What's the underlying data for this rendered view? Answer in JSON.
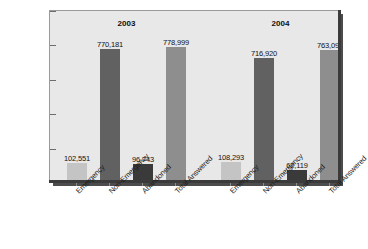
{
  "chart_data": {
    "type": "bar",
    "title": "",
    "xlabel": "",
    "ylabel": "",
    "ylim": [
      0,
      1000000
    ],
    "grid": false,
    "legend": "none",
    "ytick_labels": [
      "0",
      "200,000",
      "400,000",
      "600,000",
      "800,000",
      "1,000,000"
    ],
    "ytick_values": [
      0,
      200000,
      400000,
      600000,
      800000,
      1000000
    ],
    "group_labels": [
      "2003",
      "2004"
    ],
    "categories": [
      "Emergency",
      "Non-Emergency",
      "Abandoned",
      "Total Answered"
    ],
    "series": [
      {
        "name": "2003",
        "values": [
          102551,
          770181,
          96743,
          778999
        ],
        "value_labels": [
          "102,551",
          "770,181",
          "96,743",
          "778,999"
        ]
      },
      {
        "name": "2004",
        "values": [
          108293,
          716920,
          62119,
          763094
        ],
        "value_labels": [
          "108,293",
          "716,920",
          "62,119",
          "763,094"
        ]
      }
    ],
    "bar_colors": {
      "Emergency": "#c4c4c4",
      "Non-Emergency": "#616161",
      "Abandoned": "#3a3a3a",
      "Total Answered": "#8e8e8e"
    },
    "plot_background": "#e8e8e8",
    "axis_color": "#3b3b3b"
  }
}
